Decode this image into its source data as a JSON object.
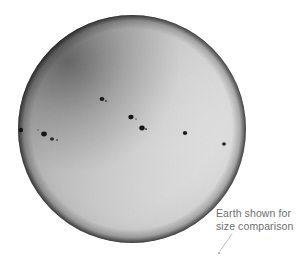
{
  "figure": {
    "kind": "astronomical-photograph",
    "background_color": "#ffffff",
    "canvas": {
      "width": 307,
      "height": 263
    }
  },
  "sun": {
    "name": "sun-disc",
    "center_x": 132,
    "center_y": 129,
    "radius": 114,
    "core_color": "#e8e8e8",
    "mid_color": "#c9c9c9",
    "limb_color": "#2a2a2a",
    "limb_darkening": "strong, concentrated along upper-left limb"
  },
  "sunspots": [
    {
      "id": "spot-top-center",
      "x": 102,
      "y": 99,
      "rx": 2.4,
      "ry": 2.1,
      "color": "#1a1a1a"
    },
    {
      "id": "spot-top-center-tail",
      "x": 106,
      "y": 101,
      "rx": 1.1,
      "ry": 0.9,
      "color": "#4a4a4a"
    },
    {
      "id": "spot-center-upper",
      "x": 131,
      "y": 117,
      "rx": 2.6,
      "ry": 2.3,
      "color": "#151515"
    },
    {
      "id": "spot-center-upper-pair",
      "x": 136,
      "y": 119,
      "rx": 1.0,
      "ry": 0.8,
      "color": "#5a5a5a"
    },
    {
      "id": "spot-center-lower",
      "x": 142,
      "y": 128,
      "rx": 2.7,
      "ry": 2.4,
      "color": "#141414"
    },
    {
      "id": "spot-center-lower-trail",
      "x": 146,
      "y": 129,
      "rx": 1.2,
      "ry": 0.9,
      "color": "#555555"
    },
    {
      "id": "spot-left-limb",
      "x": 21,
      "y": 130,
      "rx": 2.0,
      "ry": 2.2,
      "color": "#101010"
    },
    {
      "id": "spot-left-inner",
      "x": 44,
      "y": 134,
      "rx": 2.8,
      "ry": 2.4,
      "color": "#141414"
    },
    {
      "id": "spot-left-small-a",
      "x": 38,
      "y": 130,
      "rx": 0.9,
      "ry": 0.8,
      "color": "#606060"
    },
    {
      "id": "spot-left-small-b",
      "x": 52,
      "y": 139,
      "rx": 2.0,
      "ry": 1.7,
      "color": "#2a2a2a"
    },
    {
      "id": "spot-left-small-c",
      "x": 57,
      "y": 140,
      "rx": 1.1,
      "ry": 0.9,
      "color": "#575757"
    },
    {
      "id": "spot-right-mid",
      "x": 185,
      "y": 133,
      "rx": 2.2,
      "ry": 2.0,
      "color": "#1c1c1c"
    },
    {
      "id": "spot-right-outer",
      "x": 224,
      "y": 144,
      "rx": 1.9,
      "ry": 1.7,
      "color": "#242424"
    }
  ],
  "annotation": {
    "name": "earth-size-comparison-annotation",
    "line1": "Earth shown for",
    "line2": "size comparison",
    "text_color": "#6e6e6e",
    "leader_line": {
      "name": "annotation-leader-line",
      "x1": 232,
      "y1": 234,
      "x2": 220,
      "y2": 251,
      "color": "#b8b8b8"
    },
    "earth_dot": {
      "name": "earth-size-dot",
      "x": 219,
      "y": 253,
      "r": 1.1,
      "color": "#b0b0b0"
    }
  }
}
